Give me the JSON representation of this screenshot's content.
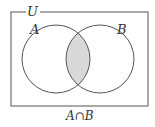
{
  "diagram": {
    "type": "venn",
    "universe_label": "U",
    "sets": [
      {
        "label": "A",
        "cx": 56,
        "cy": 59,
        "r": 34
      },
      {
        "label": "B",
        "cx": 100,
        "cy": 59,
        "r": 34
      }
    ],
    "shaded_region": "intersection",
    "caption": "A∩B",
    "colors": {
      "stroke": "#555555",
      "shade": "#d9d9d9",
      "background": "#ffffff"
    }
  }
}
